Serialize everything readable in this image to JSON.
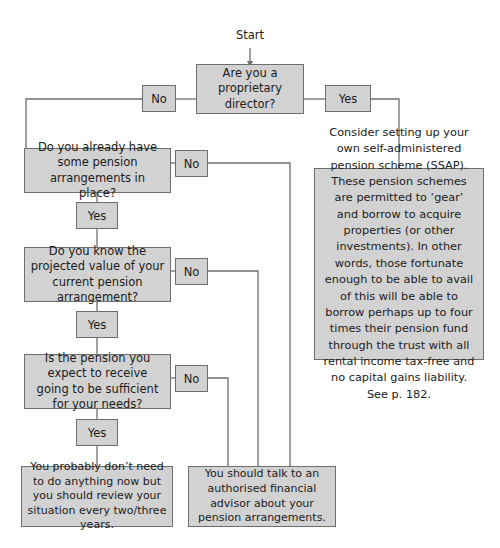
{
  "diagram": {
    "start_label": "Start",
    "colors": {
      "box_fill": "#d2d2d2",
      "box_border": "#6e6e6e",
      "line": "#6e6e6e",
      "text": "#1b1b1b",
      "background": "#ffffff"
    }
  },
  "nodes": {
    "q1": "Are you a proprietary director?",
    "q2": "Do you already have some pension arrangements in place?",
    "q3": "Do you know the projected value of your current pension arrangement?",
    "q4": "Is the pension you expect to receive going to be sufficient for your needs?",
    "info": "Consider setting up your own self-administered pension scheme (SSAP). These pension schemes are permitted to ‘gear’ and borrow to acquire properties (or other investments). In other words, those fortunate enough to be able to avail of this will be able to borrow perhaps up to four times their pension fund through the trust with all rental income tax-free and no capital gains liability. See p. 182.",
    "outcome_left": "You probably don’t need to do anything now but you should review your situation every two/three years.",
    "outcome_right": "You should talk to an authorised financial advisor about your pension arrangements."
  },
  "edge_labels": {
    "q1_no": "No",
    "q1_yes": "Yes",
    "q2_no": "No",
    "q2_yes": "Yes",
    "q3_no": "No",
    "q3_yes": "Yes",
    "q4_no": "No",
    "q4_yes": "Yes"
  }
}
